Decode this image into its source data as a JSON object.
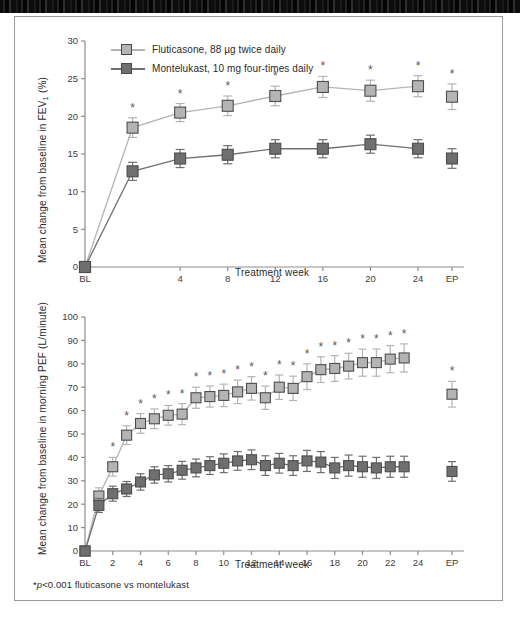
{
  "figure": {
    "footnote": "*p<0.001 fluticasone vs montelukast",
    "colors": {
      "fluticasone": "#b4b4b4",
      "montelukast": "#6f6f6f",
      "axis": "#8d8d8d",
      "text": "#2b2b2b",
      "frame": "#9a9a9a"
    }
  },
  "legend": {
    "items": [
      {
        "label": "Fluticasone, 88 µg twice daily",
        "color": "#b4b4b4",
        "key": "fluticasone"
      },
      {
        "label": "Montelukast, 10 mg four-times daily",
        "color": "#6f6f6f",
        "key": "montelukast"
      }
    ]
  },
  "chart_data": [
    {
      "id": "fev1",
      "type": "line",
      "title": "",
      "xlabel": "Treatment week",
      "ylabel": "Mean change from baseline in FEV₁ (%)",
      "ylim": [
        0,
        30
      ],
      "yticks": [
        0,
        5,
        10,
        15,
        20,
        25,
        30
      ],
      "ytick_labels": [
        "0",
        "5",
        "10",
        "15",
        "20",
        "25",
        "30"
      ],
      "xtick_labels": [
        "BL",
        "4",
        "8",
        "12",
        "16",
        "20",
        "24",
        "EP"
      ],
      "categories": [
        "BL",
        "2",
        "4",
        "8",
        "12",
        "16",
        "20",
        "24",
        "EP"
      ],
      "grid": false,
      "legend_position": "top-left",
      "series": [
        {
          "name": "Fluticasone, 88 µg twice daily",
          "color": "#b4b4b4",
          "values": [
            0,
            18.5,
            20.5,
            21.4,
            22.7,
            23.9,
            23.4,
            24.0,
            22.6
          ],
          "err_low": [
            0,
            1.3,
            1.2,
            1.3,
            1.3,
            1.4,
            1.4,
            1.4,
            1.7
          ],
          "err_high": [
            0,
            1.3,
            1.2,
            1.3,
            1.3,
            1.4,
            1.4,
            1.4,
            1.7
          ],
          "significant": [
            false,
            true,
            true,
            true,
            true,
            true,
            true,
            true,
            true
          ]
        },
        {
          "name": "Montelukast, 10 mg four-times daily",
          "color": "#6f6f6f",
          "values": [
            0,
            12.7,
            14.4,
            14.9,
            15.7,
            15.7,
            16.3,
            15.7,
            14.4
          ],
          "err_low": [
            0,
            1.2,
            1.2,
            1.2,
            1.2,
            1.2,
            1.2,
            1.2,
            1.3
          ],
          "err_high": [
            0,
            1.2,
            1.2,
            1.2,
            1.2,
            1.2,
            1.2,
            1.2,
            1.3
          ],
          "significant": [
            false,
            false,
            false,
            false,
            false,
            false,
            false,
            false,
            false
          ]
        }
      ]
    },
    {
      "id": "pef",
      "type": "line",
      "title": "",
      "xlabel": "Treatment week",
      "ylabel": "Mean change from baseline in morning PEF (L/minute)",
      "ylim": [
        0,
        100
      ],
      "yticks": [
        0,
        10,
        20,
        30,
        40,
        50,
        60,
        70,
        80,
        90,
        100
      ],
      "ytick_labels": [
        "0",
        "10",
        "20",
        "30",
        "40",
        "50",
        "60",
        "70",
        "80",
        "90",
        "100"
      ],
      "xtick_labels": [
        "BL",
        "2",
        "4",
        "6",
        "8",
        "10",
        "12",
        "14",
        "16",
        "18",
        "20",
        "22",
        "24",
        "EP"
      ],
      "categories": [
        "BL",
        "1",
        "2",
        "3",
        "4",
        "5",
        "6",
        "7",
        "8",
        "9",
        "10",
        "11",
        "12",
        "13",
        "14",
        "15",
        "16",
        "17",
        "18",
        "19",
        "20",
        "21",
        "22",
        "23",
        "24",
        "EP"
      ],
      "grid": false,
      "legend_position": "none",
      "series": [
        {
          "name": "Fluticasone, 88 µg twice daily",
          "color": "#b4b4b4",
          "values": [
            0,
            23.5,
            36.0,
            49.5,
            54.5,
            56.5,
            58.0,
            58.5,
            65.5,
            66.0,
            66.5,
            68.0,
            69.5,
            65.5,
            70.0,
            69.5,
            74.5,
            77.5,
            78.0,
            79.0,
            80.5,
            80.5,
            82.0,
            82.5,
            0,
            67.0
          ],
          "err_low": [
            0,
            3.5,
            4.0,
            4.0,
            4.2,
            4.2,
            4.2,
            4.5,
            4.5,
            4.5,
            4.8,
            5.0,
            5.0,
            5.0,
            5.2,
            5.2,
            5.5,
            5.5,
            5.5,
            5.5,
            5.8,
            5.8,
            5.8,
            6.0,
            0,
            5.5
          ],
          "err_high": [
            0,
            3.5,
            4.0,
            4.0,
            4.2,
            4.2,
            4.2,
            4.5,
            4.5,
            4.5,
            4.8,
            5.0,
            5.0,
            5.0,
            5.2,
            5.2,
            5.5,
            5.5,
            5.5,
            5.5,
            5.8,
            5.8,
            5.8,
            6.0,
            0,
            5.5
          ],
          "significant": [
            false,
            false,
            true,
            true,
            true,
            true,
            true,
            true,
            true,
            true,
            true,
            true,
            true,
            true,
            true,
            true,
            true,
            true,
            true,
            true,
            true,
            true,
            true,
            true,
            false,
            true
          ]
        },
        {
          "name": "Montelukast, 10 mg four-times daily",
          "color": "#6f6f6f",
          "values": [
            0,
            19.5,
            24.5,
            26.5,
            29.5,
            32.5,
            33.0,
            34.5,
            35.5,
            36.5,
            37.5,
            38.5,
            39.0,
            36.5,
            37.5,
            36.5,
            38.5,
            38.0,
            35.5,
            36.5,
            36.0,
            35.5,
            36.0,
            36.0,
            0,
            34.0
          ],
          "err_low": [
            0,
            3.0,
            3.2,
            3.2,
            3.5,
            3.5,
            3.5,
            3.8,
            3.8,
            3.8,
            4.0,
            4.0,
            4.2,
            4.2,
            4.2,
            4.2,
            4.5,
            4.5,
            4.5,
            4.5,
            4.5,
            4.5,
            4.5,
            4.5,
            0,
            4.2
          ],
          "err_high": [
            0,
            3.0,
            3.2,
            3.2,
            3.5,
            3.5,
            3.5,
            3.8,
            3.8,
            3.8,
            4.0,
            4.0,
            4.2,
            4.2,
            4.2,
            4.2,
            4.5,
            4.5,
            4.5,
            4.5,
            4.5,
            4.5,
            4.5,
            4.5,
            0,
            4.2
          ],
          "significant": [
            false,
            false,
            false,
            false,
            false,
            false,
            false,
            false,
            false,
            false,
            false,
            false,
            false,
            false,
            false,
            false,
            false,
            false,
            false,
            false,
            false,
            false,
            false,
            false,
            false,
            false
          ]
        }
      ]
    }
  ]
}
